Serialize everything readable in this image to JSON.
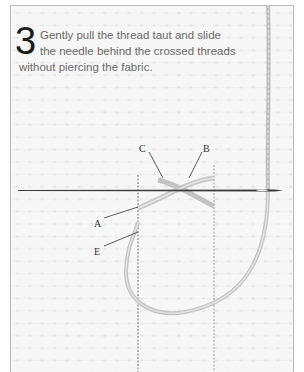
{
  "instruction": {
    "step_number": "3",
    "lines": [
      "Gently pull the thread taut and slide",
      "the needle behind the crossed threads",
      "without piercing the fabric."
    ]
  },
  "labels": {
    "a": "A",
    "b": "B",
    "c": "C",
    "e": "E"
  },
  "colors": {
    "fabric": "#f7f7f7",
    "grid_dot": "#d6d6d6",
    "frame_border": "#b8b8b8",
    "thread": "#bdbdbd",
    "needle": "#3a3a3a",
    "step_number": "#1a1a1a",
    "caption_text": "#6a6a6a"
  }
}
